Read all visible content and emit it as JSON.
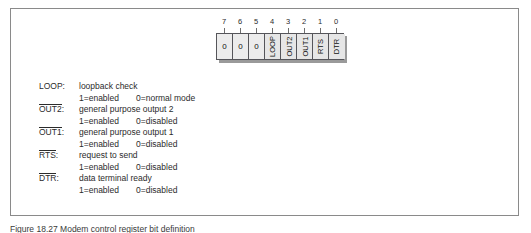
{
  "figure": {
    "caption": "Figure 18.27 Modem control register bit definition"
  },
  "bit_diagram": {
    "name": "modem-control-register",
    "bit_numbers": [
      "7",
      "6",
      "5",
      "4",
      "3",
      "2",
      "1",
      "0"
    ],
    "cells": [
      {
        "bit": "7",
        "label": "0",
        "orientation": "horizontal"
      },
      {
        "bit": "6",
        "label": "0",
        "orientation": "horizontal"
      },
      {
        "bit": "5",
        "label": "0",
        "orientation": "horizontal"
      },
      {
        "bit": "4",
        "label": "LOOP",
        "orientation": "vertical"
      },
      {
        "bit": "3",
        "label": "OUT2",
        "orientation": "vertical"
      },
      {
        "bit": "2",
        "label": "OUT1",
        "orientation": "vertical"
      },
      {
        "bit": "1",
        "label": "RTS",
        "orientation": "vertical"
      },
      {
        "bit": "0",
        "label": "DTR",
        "orientation": "vertical"
      }
    ]
  },
  "legend": {
    "entries": [
      {
        "mnemonic": "LOOP:",
        "overbar": false,
        "description": "loopback check",
        "state_on": "1=enabled",
        "state_off": "0=normal mode"
      },
      {
        "mnemonic": "OUT2:",
        "overbar": true,
        "overbar_text": "OUT2",
        "description": "general purpose output 2",
        "state_on": "1=enabled",
        "state_off": "0=disabled"
      },
      {
        "mnemonic": "OUT1:",
        "overbar": true,
        "overbar_text": "OUT1",
        "description": "general purpose output 1",
        "state_on": "1=enabled",
        "state_off": "0=disabled"
      },
      {
        "mnemonic": "RTS:",
        "overbar": true,
        "overbar_text": "RTS",
        "description": "request to send",
        "state_on": "1=enabled",
        "state_off": "0=disabled"
      },
      {
        "mnemonic": "DTR:",
        "overbar": true,
        "overbar_text": "DTR",
        "description": "data terminal ready",
        "state_on": "1=enabled",
        "state_off": "0=disabled"
      }
    ]
  },
  "colors": {
    "frame_border": "#8a8a8a",
    "cell_border": "#55555a",
    "cell_fill": "#e6e6e6",
    "shadow": "#9a9a9a",
    "text": "#2b2b2b"
  }
}
